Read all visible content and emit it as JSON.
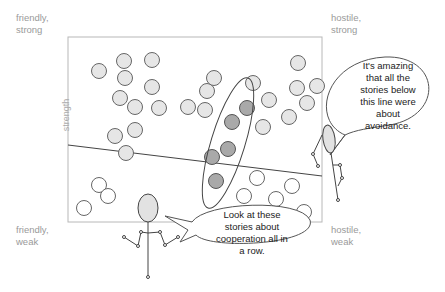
{
  "corners": {
    "top_left": {
      "line1": "friendly,",
      "line2": "strong"
    },
    "top_right": {
      "line1": "hostile,",
      "line2": "strong"
    },
    "bottom_left": {
      "line1": "friendly,",
      "line2": "weak"
    },
    "bottom_right": {
      "line1": "hostile,",
      "line2": "weak"
    }
  },
  "axis": {
    "y_label": "strength"
  },
  "bubbles": {
    "right": {
      "lines": [
        "It's amazing",
        "that all the",
        "stories below",
        "this line were",
        "about",
        "avoidance."
      ]
    },
    "bottom": {
      "lines": [
        "Look at these",
        "stories about",
        "cooperation all in",
        "a row."
      ]
    }
  },
  "colors": {
    "frame": "#b8b8b8",
    "circle_fill": "#e6e6e6",
    "circle_highlight": "#a9a9a9",
    "circle_stroke": "#666666",
    "corner_text": "#9a9a9a"
  }
}
